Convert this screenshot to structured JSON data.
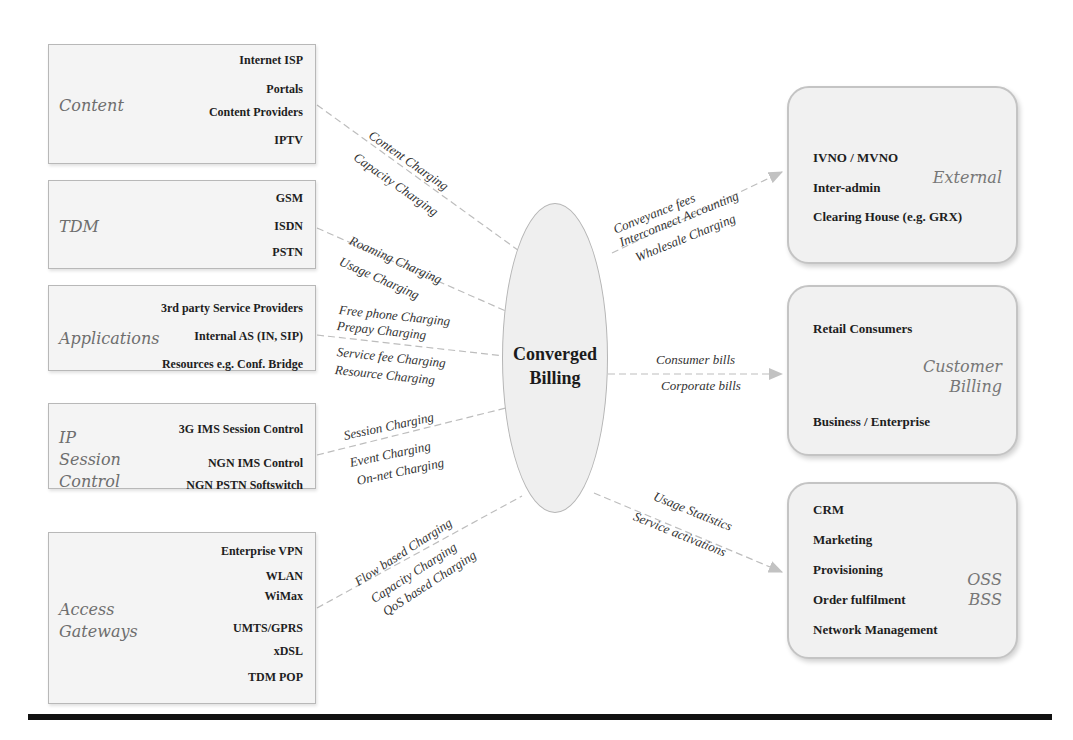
{
  "center": {
    "title_line1": "Converged",
    "title_line2": "Billing"
  },
  "left_groups": [
    {
      "category": "Content",
      "items": [
        "Internet ISP",
        "Portals",
        "Content Providers",
        "IPTV"
      ],
      "flow_labels": [
        "Content Charging",
        "Capacity Charging"
      ]
    },
    {
      "category": "TDM",
      "items": [
        "GSM",
        "ISDN",
        "PSTN"
      ],
      "flow_labels": [
        "Roaming Charging",
        "Usage Charging"
      ]
    },
    {
      "category": "Applications",
      "items": [
        "3rd party Service Providers",
        "Internal AS (IN, SIP)",
        "Resources e.g. Conf. Bridge"
      ],
      "flow_labels": [
        "Free phone Charging",
        "Prepay Charging",
        "Service fee Charging",
        "Resource Charging"
      ]
    },
    {
      "category_lines": [
        "IP",
        "Session",
        "Control"
      ],
      "items": [
        "3G IMS Session Control",
        "NGN IMS Control",
        "NGN PSTN Softswitch"
      ],
      "flow_labels": [
        "Session Charging",
        "Event Charging",
        "On-net Charging"
      ]
    },
    {
      "category_lines": [
        "Access",
        "Gateways"
      ],
      "items": [
        "Enterprise VPN",
        "WLAN",
        "WiMax",
        "UMTS/GPRS",
        "xDSL",
        "TDM POP"
      ],
      "flow_labels": [
        "Flow based Charging",
        "Capacity Charging",
        "QoS based Charging"
      ]
    }
  ],
  "right_groups": [
    {
      "category": "External",
      "items": [
        "IVNO / MVNO",
        "Inter-admin",
        "Clearing House (e.g. GRX)"
      ],
      "flow_labels": [
        "Conveyance fees",
        "Interconnect Accounting",
        "Wholesale Charging"
      ]
    },
    {
      "category_lines": [
        "Customer",
        "Billing"
      ],
      "items": [
        "Retail Consumers",
        "Business / Enterprise"
      ],
      "flow_labels": [
        "Consumer bills",
        "Corporate bills"
      ]
    },
    {
      "category_lines": [
        "OSS",
        "BSS"
      ],
      "items": [
        "CRM",
        "Marketing",
        "Provisioning",
        "Order fulfilment",
        "Network Management"
      ],
      "flow_labels": [
        "Usage Statistics",
        "Service activations"
      ]
    }
  ],
  "colors": {
    "box_fill": "#f4f4f4",
    "box_border": "#b8b8b8",
    "category_text": "#6e6e6e",
    "connector": "#bbbbbb",
    "rule": "#111111"
  }
}
